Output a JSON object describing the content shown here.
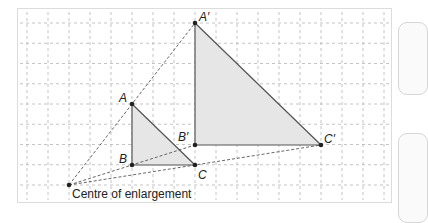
{
  "diagram": {
    "caption": "Centre of enlargement",
    "scale_factor": 2,
    "grid": {
      "origin_x": 27,
      "origin_y": 23,
      "dx": 21,
      "dy": 20.25,
      "cols": 18,
      "rows": 9
    },
    "colors": {
      "grid": "#b5b5b5",
      "triangle_fill": "#e6e6e6",
      "triangle_stroke": "#555555",
      "ray": "#555555",
      "point": "#222222",
      "border": "#dcdcdc"
    },
    "points": {
      "centre": {
        "label": "",
        "col": 2,
        "row": 8
      },
      "A": {
        "label": "A",
        "col": 5,
        "row": 4
      },
      "B": {
        "label": "B",
        "col": 5,
        "row": 7
      },
      "C": {
        "label": "C",
        "col": 8,
        "row": 7
      },
      "A_prime": {
        "label": "A′",
        "col": 8,
        "row": 0
      },
      "B_prime": {
        "label": "B′",
        "col": 8,
        "row": 6
      },
      "C_prime": {
        "label": "C′",
        "col": 14,
        "row": 6
      }
    }
  }
}
